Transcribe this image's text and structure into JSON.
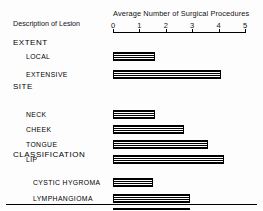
{
  "figure": {
    "axis_title": "Average Number of Surgical Procedures",
    "description_heading": "Description of Lesion"
  },
  "axis": {
    "tick_labels": [
      "0",
      "1",
      "2",
      "3",
      "4",
      "5"
    ],
    "min": 0,
    "max": 5
  },
  "groups": [
    {
      "heading": "EXTENT",
      "rows": [
        {
          "label": "LOCAL",
          "value": 1.6
        },
        {
          "label": "EXTENSIVE",
          "value": 4.1
        }
      ]
    },
    {
      "heading": "SITE",
      "rows": [
        {
          "label": "NECK",
          "value": 1.6
        },
        {
          "label": "CHEEK",
          "value": 2.7
        },
        {
          "label": "TONGUE",
          "value": 3.6
        },
        {
          "label": "LIP",
          "value": 4.2
        }
      ]
    },
    {
      "heading": "CLASSIFICATION",
      "rows": [
        {
          "label": "CYSTIC HYGROMA",
          "value": 1.5
        },
        {
          "label": "LYMPHANGIOMA",
          "value": 2.9
        },
        {
          "label": "COMBINED",
          "value": 2.9
        }
      ]
    }
  ],
  "chart_data": {
    "type": "bar",
    "orientation": "horizontal",
    "title": "Average Number of Surgical Procedures",
    "xlabel": "Average Number of Surgical Procedures",
    "ylabel": "Description of Lesion",
    "xlim": [
      0,
      5
    ],
    "xticks": [
      0,
      1,
      2,
      3,
      4,
      5
    ],
    "grid": false,
    "legend": false,
    "group_headings": [
      "EXTENT",
      "SITE",
      "CLASSIFICATION"
    ],
    "categories": [
      "LOCAL",
      "EXTENSIVE",
      "NECK",
      "CHEEK",
      "TONGUE",
      "LIP",
      "CYSTIC HYGROMA",
      "LYMPHANGIOMA",
      "COMBINED"
    ],
    "values": [
      1.6,
      4.1,
      1.6,
      2.7,
      3.6,
      4.2,
      1.5,
      2.9,
      2.9
    ]
  }
}
